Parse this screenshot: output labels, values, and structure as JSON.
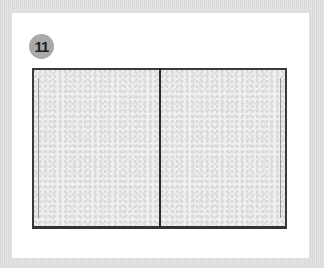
{
  "step": {
    "number": "11"
  },
  "illustration": {
    "subject": "open-book-with-marbled-pages",
    "pages": [
      "left-page",
      "right-page"
    ]
  },
  "colors": {
    "background": "#e0e0e0",
    "card": "#ffffff",
    "badge": "#a9a9a9",
    "border": "#3a3a3a"
  }
}
